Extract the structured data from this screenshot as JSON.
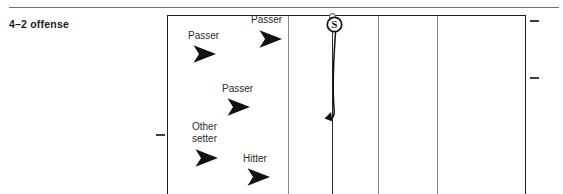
{
  "caption": "4–2 offense",
  "diagram": {
    "name": "volleyball-court-diagram",
    "type": "volleyball-rotation",
    "court": {
      "dividers": 3,
      "net_line": true,
      "ticks": [
        "left-sideline-tick",
        "right-top-antenna-tick",
        "right-mid-antenna-tick"
      ]
    },
    "players": [
      {
        "label": "Passer",
        "role": "passer",
        "label_lines": [
          "Passer"
        ],
        "x": 188,
        "y": 30,
        "marker_x": 192,
        "marker_y": 44
      },
      {
        "label": "Passer",
        "role": "passer",
        "label_lines": [
          "Passer"
        ],
        "x": 251,
        "y": 14,
        "marker_x": 258,
        "marker_y": 29
      },
      {
        "label": "Passer",
        "role": "passer",
        "label_lines": [
          "Passer"
        ],
        "x": 222,
        "y": 83,
        "marker_x": 226,
        "marker_y": 97
      },
      {
        "label": "Other setter",
        "role": "other-setter",
        "label_lines": [
          "Other",
          "setter"
        ],
        "x": 192,
        "y": 121,
        "marker_x": 194,
        "marker_y": 148
      },
      {
        "label": "Hitter",
        "role": "hitter",
        "label_lines": [
          "Hitter"
        ],
        "x": 243,
        "y": 153,
        "marker_x": 246,
        "marker_y": 167
      }
    ],
    "setter": {
      "token_label": "S",
      "name": "setter-token",
      "movement": "curved path from net down and hooking left with arrowhead"
    },
    "colors": {
      "ink": "#1d1d1d",
      "court_line": "#8a8a8a",
      "rule": "#6f6f6f",
      "text": "#2b2b2b"
    }
  }
}
